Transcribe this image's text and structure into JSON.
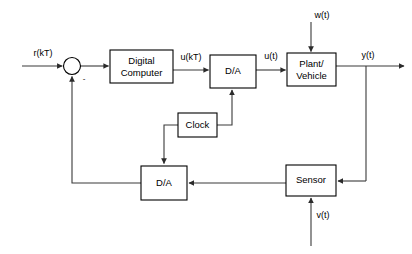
{
  "diagram": {
    "type": "block-diagram",
    "background_color": "#ffffff",
    "line_color": "#3a3a3a",
    "box_stroke_color": "#000000",
    "blocks": [
      {
        "id": "digital-computer",
        "label_line1": "Digital",
        "label_line2": "Computer",
        "x": 110,
        "y": 50,
        "w": 63,
        "h": 33
      },
      {
        "id": "da-upper",
        "label_line1": "D/A",
        "label_line2": "",
        "x": 210,
        "y": 55,
        "w": 46,
        "h": 33
      },
      {
        "id": "plant-vehicle",
        "label_line1": "Plant/",
        "label_line2": "Vehicle",
        "x": 287,
        "y": 53,
        "w": 49,
        "h": 33
      },
      {
        "id": "clock",
        "label_line1": "Clock",
        "label_line2": "",
        "x": 178,
        "y": 113,
        "w": 39,
        "h": 24
      },
      {
        "id": "da-lower",
        "label_line1": "D/A",
        "label_line2": "",
        "x": 141,
        "y": 166,
        "w": 46,
        "h": 34
      },
      {
        "id": "sensor",
        "label_line1": "Sensor",
        "label_line2": "",
        "x": 286,
        "y": 165,
        "w": 50,
        "h": 31
      }
    ],
    "summing_junction": {
      "id": "summing-junction",
      "cx": 72,
      "cy": 66,
      "r": 8.5,
      "negative_sign": "-"
    },
    "signals": [
      {
        "id": "reference-input",
        "label": "r(kT)",
        "x": 43,
        "y": 54
      },
      {
        "id": "computer-output",
        "label": "u(kT)",
        "x": 191,
        "y": 58
      },
      {
        "id": "da-output",
        "label": "u(t)",
        "x": 271,
        "y": 57
      },
      {
        "id": "plant-output",
        "label": "y(t)",
        "x": 368,
        "y": 56
      },
      {
        "id": "disturbance-input",
        "label": "w(t)",
        "x": 322,
        "y": 16
      },
      {
        "id": "noise-input",
        "label": "v(t)",
        "x": 323,
        "y": 216
      }
    ]
  }
}
